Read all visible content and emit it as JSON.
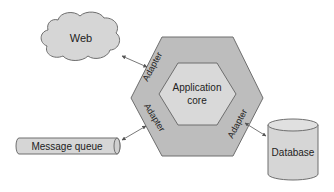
{
  "diagram": {
    "web": {
      "label": "Web"
    },
    "message_queue": {
      "label": "Message queue"
    },
    "database": {
      "label": "Database"
    },
    "core": {
      "line1": "Application",
      "line2": "core"
    },
    "adapters": [
      {
        "label": "Adapter"
      },
      {
        "label": "Adapter"
      },
      {
        "label": "Adapter"
      }
    ],
    "colors": {
      "outer_hex": "#bdbdbd",
      "inner_hex": "#d9d9d9",
      "shape_fill": "#d6d6d6",
      "stroke": "#6e6e6e"
    }
  }
}
